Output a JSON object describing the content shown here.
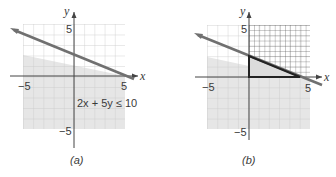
{
  "figure": {
    "panels": [
      {
        "id": "a",
        "caption": "(a)",
        "axis_x_label": "x",
        "axis_y_label": "y",
        "tick_x_neg": "−5",
        "tick_x_pos": "5",
        "tick_y_pos": "5",
        "tick_y_neg": "−5",
        "inequality_label": "2x + 5y ≤ 10",
        "shading": "half-plane below line 2x + 5y = 10"
      },
      {
        "id": "b",
        "caption": "(b)",
        "axis_x_label": "x",
        "axis_y_label": "y",
        "tick_x_neg": "−5",
        "tick_x_pos": "5",
        "tick_y_pos": "5",
        "tick_y_neg": "−5",
        "shading": "half-plane below line; first quadrant cross-hatched; feasible triangle (0,0),(5,0),(0,2) outlined"
      }
    ],
    "colors": {
      "grid_line": "#c8c8c8",
      "shade": "#e6e6e6",
      "boundary_line": "#707070",
      "axis": "#444444",
      "triangle": "#222222",
      "hatch": "#555555"
    }
  }
}
